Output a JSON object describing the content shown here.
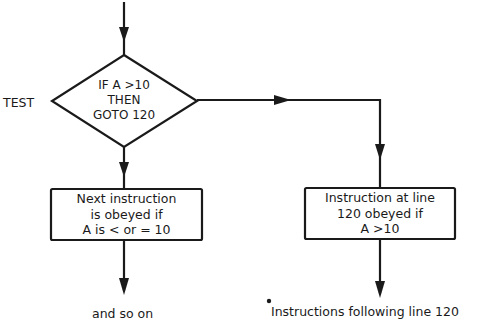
{
  "diagram": {
    "type": "flowchart",
    "decision": {
      "side_label": "TEST",
      "lines": [
        "IF A >10",
        "THEN",
        "GOTO 120"
      ]
    },
    "left_branch": {
      "box_lines": [
        "Next instruction",
        "is obeyed if",
        "A is < or = 10"
      ],
      "end_label": "and so on"
    },
    "right_branch": {
      "box_lines": [
        "Instruction at line",
        "120 obeyed if",
        "A >10"
      ],
      "end_label": "Instructions following line 120"
    },
    "colors": {
      "ink": "#1a1a1a",
      "background": "#ffffff"
    }
  }
}
